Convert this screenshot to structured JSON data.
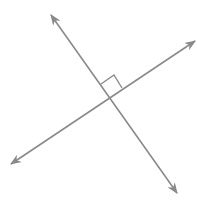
{
  "diagram": {
    "stroke_color": "#8a8a8a",
    "background": "#ffffff",
    "lines": [
      {
        "name": "line-a",
        "x1": 51,
        "y1": 15,
        "x2": 177,
        "y2": 193
      },
      {
        "name": "line-b",
        "x1": 11,
        "y1": 164,
        "x2": 195,
        "y2": 41
      }
    ],
    "intersection": {
      "x": 109,
      "y": 96
    },
    "right_angle_marker": {
      "points": "101,84 114,75 122,88"
    }
  }
}
